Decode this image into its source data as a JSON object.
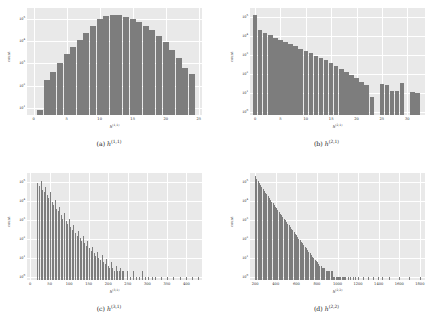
{
  "figure": {
    "background": "#ffffff",
    "axes_facecolor": "#e9e9e9",
    "bar_color": "#7d7d7d",
    "grid_color": "#ffffff"
  },
  "panels": [
    {
      "id": "a",
      "caption_prefix": "(a)",
      "caption_symbol": "h",
      "caption_superscript": "(1,1)",
      "ylabel": "count",
      "xlabel_symbol": "h",
      "xlabel_superscript": "(1,1)",
      "yticks": [
        "10¹",
        "10²",
        "10³",
        "10⁴",
        "10⁵"
      ],
      "ytick_exponents": [
        1,
        2,
        3,
        4,
        5
      ],
      "xticks": [
        "0",
        "5",
        "10",
        "15",
        "20",
        "25"
      ]
    },
    {
      "id": "b",
      "caption_prefix": "(b)",
      "caption_symbol": "h",
      "caption_superscript": "(2,1)",
      "ylabel": "count",
      "xlabel_symbol": "h",
      "xlabel_superscript": "(2,1)",
      "yticks": [
        "10⁰",
        "10¹",
        "10²",
        "10³",
        "10⁴",
        "10⁵"
      ],
      "ytick_exponents": [
        0,
        1,
        2,
        3,
        4,
        5
      ],
      "xticks": [
        "0",
        "5",
        "10",
        "15",
        "20",
        "25",
        "30"
      ]
    },
    {
      "id": "c",
      "caption_prefix": "(c)",
      "caption_symbol": "h",
      "caption_superscript": "(3,1)",
      "ylabel": "count",
      "xlabel_symbol": "h",
      "xlabel_superscript": "(3,1)",
      "yticks": [
        "10⁰",
        "10¹",
        "10²",
        "10³",
        "10⁴",
        "10⁵"
      ],
      "ytick_exponents": [
        0,
        1,
        2,
        3,
        4,
        5
      ],
      "xticks": [
        "0",
        "50",
        "100",
        "150",
        "200",
        "250",
        "300",
        "350",
        "400"
      ]
    },
    {
      "id": "d",
      "caption_prefix": "(d)",
      "caption_symbol": "h",
      "caption_superscript": "(2,2)",
      "ylabel": "count",
      "xlabel_symbol": "h",
      "xlabel_superscript": "(2,2)",
      "yticks": [
        "10⁰",
        "10¹",
        "10²",
        "10³",
        "10⁴",
        "10⁵"
      ],
      "ytick_exponents": [
        0,
        1,
        2,
        3,
        4,
        5
      ],
      "xticks": [
        "200",
        "400",
        "600",
        "800",
        "1000",
        "1200",
        "1400",
        "1600",
        "1800"
      ]
    }
  ],
  "chart_data": [
    {
      "type": "bar",
      "panel": "a",
      "title": "(a) h^(1,1)",
      "xlabel": "h^(1,1)",
      "ylabel": "count",
      "yscale": "log",
      "ylim": [
        5,
        300000
      ],
      "xlim": [
        -1,
        25.5
      ],
      "grid": true,
      "x": [
        1,
        2,
        3,
        4,
        5,
        6,
        7,
        8,
        9,
        10,
        11,
        12,
        13,
        14,
        15,
        16,
        17,
        18,
        19,
        20,
        21,
        22,
        23,
        24
      ],
      "values": [
        8,
        180,
        420,
        1100,
        2600,
        5500,
        11000,
        23000,
        48000,
        95000,
        130000,
        145000,
        140000,
        120000,
        95000,
        70000,
        48000,
        30000,
        17000,
        9000,
        4200,
        1800,
        620,
        330
      ],
      "tick_labels_x": [
        "0",
        "5",
        "10",
        "15",
        "20",
        "25"
      ],
      "tick_labels_y": [
        "10^1",
        "10^2",
        "10^3",
        "10^4",
        "10^5"
      ]
    },
    {
      "type": "bar",
      "panel": "b",
      "title": "(b) h^(2,1)",
      "xlabel": "h^(2,1)",
      "ylabel": "count",
      "yscale": "log",
      "ylim": [
        0.7,
        300000
      ],
      "xlim": [
        -1,
        33.5
      ],
      "grid": true,
      "x": [
        0,
        1,
        2,
        3,
        4,
        5,
        6,
        7,
        8,
        9,
        10,
        11,
        12,
        13,
        14,
        15,
        16,
        17,
        18,
        19,
        20,
        21,
        22,
        23,
        24,
        25,
        26,
        27,
        28,
        29,
        30,
        31,
        32
      ],
      "values": [
        130000,
        21000,
        14000,
        11000,
        8000,
        6500,
        5000,
        3800,
        2900,
        2200,
        1700,
        1300,
        950,
        720,
        520,
        380,
        270,
        190,
        130,
        90,
        60,
        40,
        26,
        6,
        0,
        30,
        28,
        13,
        13,
        33,
        0,
        11,
        10
      ],
      "tick_labels_x": [
        "0",
        "5",
        "10",
        "15",
        "20",
        "25",
        "30"
      ],
      "tick_labels_y": [
        "10^0",
        "10^1",
        "10^2",
        "10^3",
        "10^4",
        "10^5"
      ]
    },
    {
      "type": "bar",
      "panel": "c",
      "title": "(c) h^(3,1)",
      "xlabel": "h^(3,1)",
      "ylabel": "count",
      "yscale": "log",
      "ylim": [
        0.7,
        300000
      ],
      "xlim": [
        -8,
        440
      ],
      "grid": true,
      "note": "sparse spiky histogram, many isolated narrow bars",
      "x": [
        20,
        24,
        28,
        32,
        36,
        40,
        44,
        48,
        52,
        56,
        60,
        64,
        68,
        72,
        76,
        80,
        84,
        88,
        92,
        96,
        100,
        104,
        108,
        112,
        116,
        120,
        124,
        128,
        132,
        136,
        140,
        144,
        148,
        152,
        156,
        160,
        164,
        168,
        172,
        176,
        180,
        184,
        188,
        192,
        196,
        200,
        204,
        208,
        212,
        216,
        220,
        224,
        228,
        232,
        236,
        240,
        248,
        256,
        264,
        272,
        280,
        288,
        296,
        304,
        312,
        320,
        336,
        352,
        368,
        384,
        400,
        416,
        430
      ],
      "values": [
        90000,
        60000,
        120000,
        40000,
        30000,
        55000,
        20000,
        15000,
        30000,
        9000,
        6000,
        12000,
        4000,
        3000,
        5000,
        1800,
        1200,
        2400,
        900,
        600,
        1100,
        420,
        300,
        550,
        220,
        150,
        280,
        110,
        80,
        140,
        60,
        45,
        75,
        33,
        24,
        40,
        18,
        13,
        22,
        10,
        8,
        14,
        6,
        5,
        9,
        4,
        3,
        6,
        3,
        2,
        4,
        2,
        2,
        3,
        2,
        2,
        2,
        1,
        2,
        1,
        1,
        2,
        1,
        1,
        1,
        1,
        1,
        1,
        1,
        1,
        1,
        1,
        1
      ],
      "tick_labels_x": [
        "0",
        "50",
        "100",
        "150",
        "200",
        "250",
        "300",
        "350",
        "400"
      ],
      "tick_labels_y": [
        "10^0",
        "10^1",
        "10^2",
        "10^3",
        "10^4",
        "10^5"
      ]
    },
    {
      "type": "bar",
      "panel": "d",
      "title": "(d) h^(2,2)",
      "xlabel": "h^(2,2)",
      "ylabel": "count",
      "yscale": "log",
      "ylim": [
        0.7,
        300000
      ],
      "xlim": [
        150,
        1850
      ],
      "grid": true,
      "note": "dense decaying comb of narrow bars from ~200 to ~1800",
      "x": [
        204,
        216,
        228,
        240,
        252,
        264,
        276,
        288,
        300,
        312,
        324,
        336,
        348,
        360,
        372,
        384,
        396,
        408,
        420,
        432,
        444,
        456,
        468,
        480,
        492,
        504,
        516,
        528,
        540,
        552,
        564,
        576,
        588,
        600,
        612,
        624,
        636,
        648,
        660,
        672,
        684,
        696,
        708,
        720,
        732,
        744,
        756,
        768,
        780,
        792,
        804,
        816,
        828,
        840,
        852,
        864,
        876,
        888,
        900,
        912,
        924,
        936,
        948,
        960,
        972,
        984,
        996,
        1008,
        1020,
        1032,
        1044,
        1056,
        1068,
        1080,
        1104,
        1128,
        1152,
        1176,
        1200,
        1248,
        1296,
        1344,
        1392,
        1440,
        1500,
        1600,
        1700,
        1800
      ],
      "values": [
        200000,
        150000,
        110000,
        90000,
        70000,
        55000,
        44000,
        35000,
        28000,
        23000,
        18000,
        15000,
        12000,
        9500,
        7800,
        6200,
        5000,
        4100,
        3300,
        2700,
        2200,
        1800,
        1450,
        1200,
        980,
        800,
        650,
        530,
        430,
        350,
        290,
        240,
        195,
        160,
        130,
        105,
        88,
        72,
        59,
        48,
        40,
        33,
        27,
        22,
        18,
        15,
        12,
        10,
        8,
        7,
        6,
        5,
        4,
        4,
        3,
        3,
        3,
        2,
        2,
        2,
        2,
        2,
        2,
        1,
        1,
        1,
        1,
        1,
        1,
        1,
        1,
        1,
        1,
        1,
        1,
        1,
        1,
        1,
        1,
        1,
        1,
        1,
        1,
        1,
        1,
        1,
        1,
        1
      ],
      "tick_labels_x": [
        "200",
        "400",
        "600",
        "800",
        "1000",
        "1200",
        "1400",
        "1600",
        "1800"
      ],
      "tick_labels_y": [
        "10^0",
        "10^1",
        "10^2",
        "10^3",
        "10^4",
        "10^5"
      ]
    }
  ]
}
